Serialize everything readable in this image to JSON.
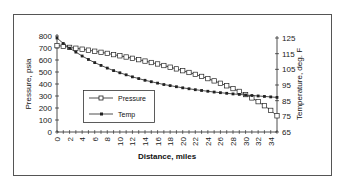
{
  "chart_data": {
    "type": "line",
    "title": "",
    "xlabel": "Distance, miles",
    "ylabel": "Pressure, psia",
    "y2label": "Temperature, deg. F",
    "xlim": [
      0,
      35
    ],
    "ylim": [
      0,
      800
    ],
    "y2lim": [
      65,
      125
    ],
    "x_ticks": [
      0,
      2,
      4,
      6,
      8,
      10,
      12,
      14,
      16,
      18,
      20,
      22,
      24,
      26,
      28,
      30,
      32,
      34
    ],
    "y_ticks": [
      0,
      100,
      200,
      300,
      400,
      500,
      600,
      700,
      800
    ],
    "y2_ticks": [
      65,
      75,
      85,
      95,
      105,
      115,
      125
    ],
    "grid": false,
    "legend_position": "inside-lower-left",
    "x": [
      0,
      1,
      2,
      3,
      4,
      5,
      6,
      7,
      8,
      9,
      10,
      11,
      12,
      13,
      14,
      15,
      16,
      17,
      18,
      19,
      20,
      21,
      22,
      23,
      24,
      25,
      26,
      27,
      28,
      29,
      30,
      31,
      32,
      33,
      34,
      35
    ],
    "series": [
      {
        "name": "Pressure",
        "axis": "left",
        "marker": "open-square",
        "values": [
          720,
          715,
          705,
          698,
          690,
          682,
          673,
          664,
          655,
          645,
          635,
          625,
          614,
          603,
          591,
          579,
          567,
          554,
          540,
          526,
          511,
          496,
          480,
          463,
          445,
          426,
          406,
          385,
          362,
          338,
          312,
          284,
          253,
          219,
          180,
          135
        ]
      },
      {
        "name": "Temp",
        "axis": "right",
        "marker": "filled-square",
        "values": [
          125,
          121.5,
          118.5,
          116,
          113.5,
          111.3,
          109.3,
          107.5,
          105.8,
          104.2,
          102.8,
          101.5,
          100.2,
          99.1,
          98,
          97.1,
          96.2,
          95.3,
          94.6,
          93.9,
          93.2,
          92.6,
          92,
          91.5,
          91,
          90.5,
          90.1,
          89.7,
          89.3,
          89,
          88.6,
          88.3,
          88,
          87.7,
          87.4,
          87.1
        ]
      }
    ]
  },
  "legend": {
    "pressure_label": "Pressure",
    "temp_label": "Temp"
  },
  "axes": {
    "x_title": "Distance, miles",
    "y_title": "Pressure, psia",
    "y2_title": "Temperature, deg. F"
  }
}
